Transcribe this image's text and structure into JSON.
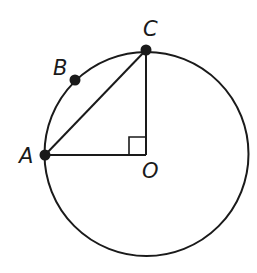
{
  "diagram": {
    "type": "geometry-circle",
    "circle": {
      "center": "O",
      "cx": 146.5,
      "cy": 154,
      "r": 102
    },
    "points": [
      {
        "id": "A",
        "label": "A",
        "x": 45,
        "y": 155,
        "on_circle": true,
        "dot": true
      },
      {
        "id": "B",
        "label": "B",
        "x": 75,
        "y": 80,
        "on_circle": true,
        "dot": true
      },
      {
        "id": "C",
        "label": "C",
        "x": 146,
        "y": 50,
        "on_circle": true,
        "dot": true
      },
      {
        "id": "O",
        "label": "O",
        "x": 146,
        "y": 155,
        "on_circle": false,
        "dot": false
      }
    ],
    "segments": [
      {
        "from": "A",
        "to": "C"
      },
      {
        "from": "A",
        "to": "O"
      },
      {
        "from": "O",
        "to": "C"
      }
    ],
    "right_angle_marker": {
      "at": "O"
    },
    "colors": {
      "stroke": "#1a1a1a",
      "background": "#ffffff"
    }
  },
  "labels": {
    "A": "A",
    "B": "B",
    "C": "C",
    "O": "O"
  }
}
